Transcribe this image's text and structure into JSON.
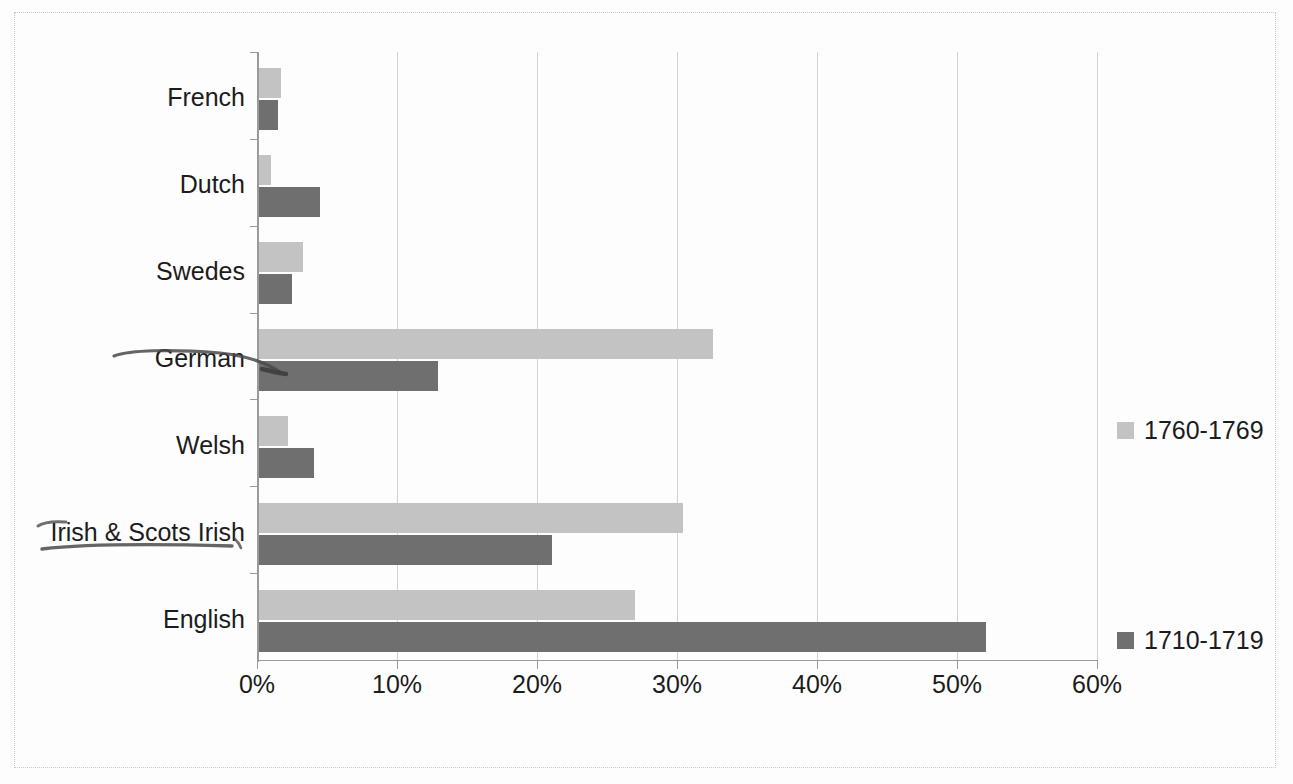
{
  "chart_data": {
    "type": "bar",
    "orientation": "horizontal",
    "title": "",
    "subtitle": "",
    "xlabel": "",
    "ylabel": "",
    "categories": [
      "English",
      "Irish & Scots Irish",
      "Welsh",
      "German",
      "Swedes",
      "Dutch",
      "French"
    ],
    "series": [
      {
        "name": "1710-1719",
        "color": "#6f6f6f",
        "values": [
          52.1,
          21.1,
          4.1,
          12.9,
          2.5,
          4.5,
          1.5
        ]
      },
      {
        "name": "1760-1769",
        "color": "#c3c3c3",
        "values": [
          27.0,
          30.4,
          2.2,
          32.6,
          3.3,
          1.0,
          1.7
        ]
      }
    ],
    "xlim": [
      0,
      60
    ],
    "xtick_values": [
      0,
      10,
      20,
      30,
      40,
      50,
      60
    ],
    "xtick_labels": [
      "0%",
      "10%",
      "20%",
      "30%",
      "40%",
      "50%",
      "60%"
    ],
    "grid": true,
    "grid_axis": "x",
    "legend_position": "right",
    "legend": [
      {
        "label": "1760-1769",
        "color": "#c3c3c3"
      },
      {
        "label": "1710-1719",
        "color": "#6f6f6f"
      }
    ],
    "value_suffix": "%"
  },
  "annotations": [
    {
      "name": "german-pen-arrow",
      "target": "German",
      "note": "hand-drawn ink line struck through label pointing to the 1710-1719 bar"
    },
    {
      "name": "irish-pen-underline",
      "target": "Irish & Scots Irish",
      "note": "hand-drawn ink underline beneath label"
    }
  ]
}
